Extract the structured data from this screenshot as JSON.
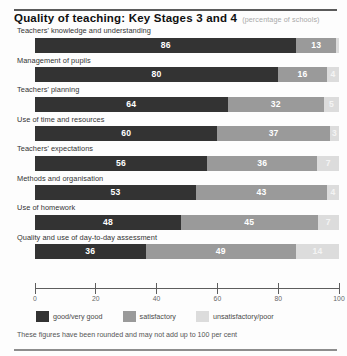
{
  "header": {
    "title": "Quality of teaching: Key Stages 3 and 4",
    "subtitle": "(percentage of schools)"
  },
  "footnote": "These figures have been rounded and may not add up to 100 per cent",
  "legend": {
    "items": [
      {
        "label": "good/very good",
        "color": "#333333",
        "swatch_name": "legend-swatch-good"
      },
      {
        "label": "satisfactory",
        "color": "#9a9a9a",
        "swatch_name": "legend-swatch-satisfactory"
      },
      {
        "label": "unsatisfactory/poor",
        "color": "#dcdcdc",
        "swatch_name": "legend-swatch-unsatisfactory"
      }
    ]
  },
  "chart_data": {
    "type": "bar",
    "title": "Quality of teaching: Key Stages 3 and 4",
    "subtitle": "(percentage of schools)",
    "orientation": "horizontal",
    "stacked": true,
    "stack_total": 100,
    "xlabel": "",
    "ylabel": "",
    "xlim": [
      0,
      100
    ],
    "xticks": [
      0,
      20,
      40,
      60,
      80,
      100
    ],
    "xtick_labels": [
      "0",
      "20",
      "40",
      "60",
      "80",
      "100"
    ],
    "grid": false,
    "legend_position": "bottom",
    "categories": [
      "Teachers' knowledge and understanding",
      "Management of pupils",
      "Teachers' planning",
      "Use of time and resources",
      "Teachers' expectations",
      "Methods and organisation",
      "Use of homework",
      "Quality and use of day-to-day assessment"
    ],
    "series": [
      {
        "name": "good/very good",
        "color": "#333333",
        "values": [
          86,
          80,
          64,
          60,
          56,
          53,
          48,
          36
        ]
      },
      {
        "name": "satisfactory",
        "color": "#9a9a9a",
        "values": [
          13,
          16,
          32,
          37,
          36,
          43,
          45,
          49
        ]
      },
      {
        "name": "unsatisfactory/poor",
        "color": "#dcdcdc",
        "values": [
          1,
          4,
          5,
          3,
          7,
          4,
          7,
          14
        ]
      }
    ],
    "bars": [
      {
        "label": "Teachers' knowledge and understanding",
        "segments": [
          {
            "series": "good/very good",
            "value": 86,
            "label": "86",
            "show_label": true
          },
          {
            "series": "satisfactory",
            "value": 13,
            "label": "13",
            "show_label": true
          },
          {
            "series": "unsatisfactory/poor",
            "value": 1,
            "label": "",
            "show_label": false
          }
        ]
      },
      {
        "label": "Management of pupils",
        "segments": [
          {
            "series": "good/very good",
            "value": 80,
            "label": "80",
            "show_label": true
          },
          {
            "series": "satisfactory",
            "value": 16,
            "label": "16",
            "show_label": true
          },
          {
            "series": "unsatisfactory/poor",
            "value": 4,
            "label": "4",
            "show_label": true
          }
        ]
      },
      {
        "label": "Teachers' planning",
        "segments": [
          {
            "series": "good/very good",
            "value": 64,
            "label": "64",
            "show_label": true
          },
          {
            "series": "satisfactory",
            "value": 32,
            "label": "32",
            "show_label": true
          },
          {
            "series": "unsatisfactory/poor",
            "value": 5,
            "label": "5",
            "show_label": true
          }
        ]
      },
      {
        "label": "Use of time and resources",
        "segments": [
          {
            "series": "good/very good",
            "value": 60,
            "label": "60",
            "show_label": true
          },
          {
            "series": "satisfactory",
            "value": 37,
            "label": "37",
            "show_label": true
          },
          {
            "series": "unsatisfactory/poor",
            "value": 3,
            "label": "3",
            "show_label": true
          }
        ]
      },
      {
        "label": "Teachers' expectations",
        "segments": [
          {
            "series": "good/very good",
            "value": 56,
            "label": "56",
            "show_label": true
          },
          {
            "series": "satisfactory",
            "value": 36,
            "label": "36",
            "show_label": true
          },
          {
            "series": "unsatisfactory/poor",
            "value": 7,
            "label": "7",
            "show_label": true
          }
        ]
      },
      {
        "label": "Methods and organisation",
        "segments": [
          {
            "series": "good/very good",
            "value": 53,
            "label": "53",
            "show_label": true
          },
          {
            "series": "satisfactory",
            "value": 43,
            "label": "43",
            "show_label": true
          },
          {
            "series": "unsatisfactory/poor",
            "value": 4,
            "label": "4",
            "show_label": true
          }
        ]
      },
      {
        "label": "Use of homework",
        "segments": [
          {
            "series": "good/very good",
            "value": 48,
            "label": "48",
            "show_label": true
          },
          {
            "series": "satisfactory",
            "value": 45,
            "label": "45",
            "show_label": true
          },
          {
            "series": "unsatisfactory/poor",
            "value": 7,
            "label": "7",
            "show_label": true
          }
        ]
      },
      {
        "label": "Quality and use of day-to-day assessment",
        "segments": [
          {
            "series": "good/very good",
            "value": 36,
            "label": "36",
            "show_label": true
          },
          {
            "series": "satisfactory",
            "value": 49,
            "label": "49",
            "show_label": true
          },
          {
            "series": "unsatisfactory/poor",
            "value": 14,
            "label": "14",
            "show_label": true
          }
        ]
      }
    ]
  }
}
